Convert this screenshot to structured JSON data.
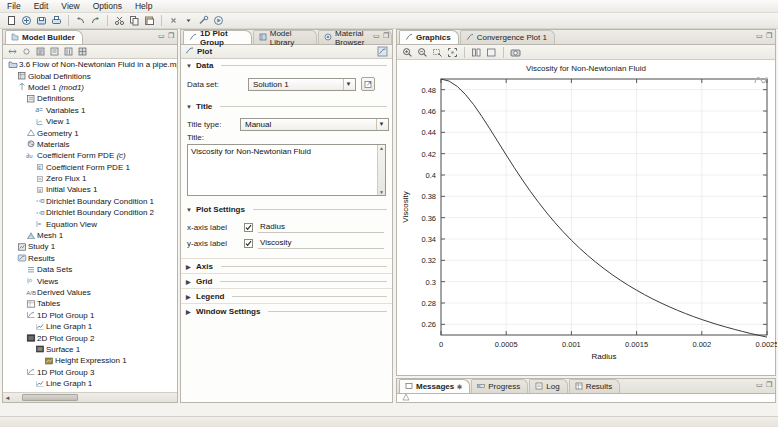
{
  "app": {
    "menu": [
      "File",
      "Edit",
      "View",
      "Options",
      "Help"
    ],
    "toolbar_icons": [
      "new-icon",
      "open-icon",
      "save-icon",
      "print-icon",
      "undo-icon",
      "redo-icon",
      "cut-icon",
      "copy-icon",
      "paste-icon",
      "delete-icon",
      "build-icon",
      "compute-icon"
    ]
  },
  "model_builder": {
    "tab_label": "Model Builder",
    "tab_icon": "model-builder-icon",
    "toolbar_icons": [
      "collapse-icon",
      "expand-icon",
      "show-icon",
      "hide-icon",
      "options-icon",
      "zoom-icon"
    ],
    "tree": [
      {
        "depth": 0,
        "label": "3.6 Flow of Non-Newtonian Fluid in a pipe.mph",
        "icon": "root-icon"
      },
      {
        "depth": 1,
        "label": "Global Definitions",
        "icon": "global-definitions-icon"
      },
      {
        "depth": 1,
        "label": "Model 1 ",
        "italic": "(mod1)",
        "icon": "model-icon"
      },
      {
        "depth": 2,
        "label": "Definitions",
        "icon": "definitions-icon"
      },
      {
        "depth": 3,
        "label": "Variables 1",
        "icon": "variables-icon"
      },
      {
        "depth": 3,
        "label": "View 1",
        "icon": "view-icon"
      },
      {
        "depth": 2,
        "label": "Geometry 1",
        "icon": "geometry-icon"
      },
      {
        "depth": 2,
        "label": "Materials",
        "icon": "materials-icon"
      },
      {
        "depth": 2,
        "label": "Coefficient Form PDE ",
        "italic": "(c)",
        "icon": "pde-icon"
      },
      {
        "depth": 3,
        "label": "Coefficient Form PDE 1",
        "icon": "pde-node-icon"
      },
      {
        "depth": 3,
        "label": "Zero Flux 1",
        "icon": "zero-flux-icon"
      },
      {
        "depth": 3,
        "label": "Initial Values 1",
        "icon": "initial-values-icon"
      },
      {
        "depth": 3,
        "label": "Dirichlet Boundary Condition 1",
        "icon": "dirichlet-icon"
      },
      {
        "depth": 3,
        "label": "Dirichlet Boundary Condition 2",
        "icon": "dirichlet-icon"
      },
      {
        "depth": 3,
        "label": "Equation View",
        "icon": "equation-view-icon"
      },
      {
        "depth": 2,
        "label": "Mesh 1",
        "icon": "mesh-icon"
      },
      {
        "depth": 1,
        "label": "Study 1",
        "icon": "study-icon"
      },
      {
        "depth": 1,
        "label": "Results",
        "icon": "results-icon"
      },
      {
        "depth": 2,
        "label": "Data Sets",
        "icon": "data-sets-icon"
      },
      {
        "depth": 2,
        "label": "Views",
        "icon": "views-icon"
      },
      {
        "depth": 2,
        "label": "Derived Values",
        "icon": "derived-values-icon"
      },
      {
        "depth": 2,
        "label": "Tables",
        "icon": "tables-icon"
      },
      {
        "depth": 2,
        "label": "1D Plot Group 1",
        "icon": "plot-group-1d-icon"
      },
      {
        "depth": 3,
        "label": "Line Graph 1",
        "icon": "line-graph-icon"
      },
      {
        "depth": 2,
        "label": "2D Plot Group 2",
        "icon": "plot-group-2d-icon"
      },
      {
        "depth": 3,
        "label": "Surface 1",
        "icon": "surface-icon"
      },
      {
        "depth": 4,
        "label": "Height Expression 1",
        "icon": "height-expression-icon"
      },
      {
        "depth": 2,
        "label": "1D Plot Group 3",
        "icon": "plot-group-1d-icon"
      },
      {
        "depth": 3,
        "label": "Line Graph 1",
        "icon": "line-graph-icon"
      },
      {
        "depth": 1,
        "label": "Export",
        "icon": "export-icon"
      },
      {
        "depth": 1,
        "label": "Reports",
        "icon": "reports-icon"
      }
    ]
  },
  "settings": {
    "tabs": [
      {
        "label": "1D Plot Group",
        "icon": "plot-group-1d-icon",
        "active": true
      },
      {
        "label": "Model Library",
        "icon": "model-library-icon",
        "active": false
      },
      {
        "label": "Material Browser",
        "icon": "material-browser-icon",
        "active": false
      }
    ],
    "header": "Plot",
    "header_icon": "plot-icon",
    "sections": {
      "data": {
        "title": "Data",
        "data_set_label": "Data set:",
        "data_set_value": "Solution 1",
        "go_to_source_icon": "go-to-source-icon"
      },
      "title": {
        "title": "Title",
        "title_type_label": "Title type:",
        "title_type_value": "Manual",
        "title_label": "Title:",
        "title_text": "Viscosity for Non-Newtonian Fluid"
      },
      "plot_settings": {
        "title": "Plot Settings",
        "x_axis_label_caption": "x-axis label",
        "x_axis_label_value": "Radius",
        "x_axis_checked": true,
        "y_axis_label_caption": "y-axis label",
        "y_axis_label_value": "Viscosity",
        "y_axis_checked": true
      },
      "collapsed": [
        "Axis",
        "Grid",
        "Legend",
        "Window Settings"
      ]
    }
  },
  "graphics": {
    "tabs": [
      {
        "label": "Graphics",
        "icon": "graphics-icon",
        "active": true
      },
      {
        "label": "Convergence Plot 1",
        "icon": "convergence-plot-icon",
        "active": false
      }
    ],
    "toolbar_icons": [
      "zoom-in-icon",
      "zoom-out-icon",
      "zoom-box-icon",
      "zoom-extents-icon",
      "scene-light-icon",
      "transparency-icon",
      "image-snapshot-icon"
    ]
  },
  "messages": {
    "tabs": [
      {
        "label": "Messages",
        "icon": "messages-icon",
        "active": true
      },
      {
        "label": "Progress",
        "icon": "progress-icon",
        "active": false
      },
      {
        "label": "Log",
        "icon": "log-icon",
        "active": false
      },
      {
        "label": "Results",
        "icon": "results-table-icon",
        "active": false
      }
    ]
  },
  "chart_data": {
    "type": "line",
    "title": "Viscosity for Non-Newtonian Fluid",
    "xlabel": "Radius",
    "ylabel": "Viscosity",
    "xlim": [
      0,
      0.0025
    ],
    "ylim": [
      0.25,
      0.49
    ],
    "xticks": [
      0,
      0.0005,
      0.001,
      0.0015,
      0.002,
      0.0025
    ],
    "xticklabels": [
      "0",
      "0.0005",
      "0.001",
      "0.0015",
      "0.002",
      "0.0025"
    ],
    "yticks": [
      0.26,
      0.28,
      0.3,
      0.32,
      0.34,
      0.36,
      0.38,
      0.4,
      0.42,
      0.44,
      0.46,
      0.48
    ],
    "yticklabels": [
      "0.26",
      "0.28",
      "0.3",
      "0.32",
      "0.34",
      "0.36",
      "0.38",
      "0.4",
      "0.42",
      "0.44",
      "0.46",
      "0.48"
    ],
    "grid": true,
    "legend": false,
    "line_color": "#3a3a3a",
    "series": [
      {
        "name": "Viscosity",
        "x": [
          0.0,
          6.25e-05,
          0.000125,
          0.0001875,
          0.00025,
          0.0003125,
          0.000375,
          0.0004375,
          0.0005,
          0.0005625,
          0.000625,
          0.0006875,
          0.00075,
          0.0008125,
          0.000875,
          0.0009375,
          0.001,
          0.0010625,
          0.001125,
          0.0011875,
          0.00125,
          0.0013125,
          0.001375,
          0.0014375,
          0.0015,
          0.0015625,
          0.001625,
          0.0016875,
          0.00175,
          0.0018125,
          0.001875,
          0.0019375,
          0.002,
          0.0020625,
          0.002125,
          0.0021875,
          0.00225,
          0.0023125,
          0.002375,
          0.0024375,
          0.0025
        ],
        "y": [
          0.49,
          0.488,
          0.483,
          0.4755,
          0.466,
          0.455,
          0.4432,
          0.431,
          0.4188,
          0.4068,
          0.3953,
          0.3843,
          0.374,
          0.3643,
          0.3552,
          0.3467,
          0.3388,
          0.3314,
          0.3246,
          0.3182,
          0.3122,
          0.3066,
          0.3014,
          0.2965,
          0.292,
          0.2877,
          0.2837,
          0.28,
          0.2765,
          0.2732,
          0.2701,
          0.2672,
          0.2645,
          0.262,
          0.2596,
          0.2574,
          0.2553,
          0.2533,
          0.2514,
          0.2497,
          0.248
        ]
      }
    ]
  }
}
